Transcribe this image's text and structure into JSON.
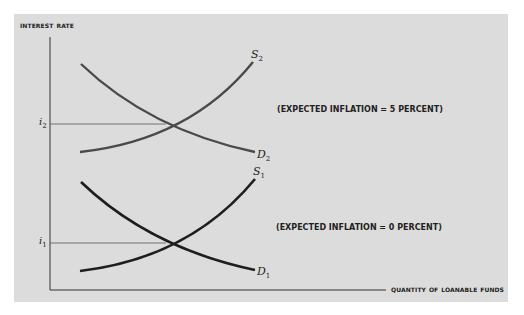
{
  "diagram": {
    "y_axis_title": "Interest rate",
    "x_axis_title": "Quantity of loanable funds",
    "annotations": {
      "inflation_5": "(EXPECTED INFLATION = 5 PERCENT)",
      "inflation_0": "(EXPECTED INFLATION = 0 PERCENT)"
    },
    "tick_labels": {
      "i2": {
        "base": "i",
        "sub": "2"
      },
      "i1": {
        "base": "i",
        "sub": "1"
      }
    },
    "curve_labels": {
      "S2": {
        "base": "S",
        "sub": "2"
      },
      "D2": {
        "base": "D",
        "sub": "2"
      },
      "S1": {
        "base": "S",
        "sub": "1"
      },
      "D1": {
        "base": "D",
        "sub": "1"
      }
    },
    "colors": {
      "background": "#ffffff",
      "panel": "#dcdcdc",
      "upper_curves": "#4a4a4a",
      "lower_curves": "#1e1e1e",
      "axes": "#333333"
    }
  }
}
